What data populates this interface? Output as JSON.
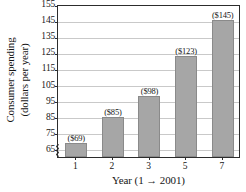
{
  "chart_data": {
    "type": "bar",
    "title": "",
    "categories": [
      "1",
      "2",
      "3",
      "5",
      "7"
    ],
    "values": [
      69,
      85,
      98,
      123,
      145
    ],
    "data_labels": [
      "($69)",
      "($85)",
      "($98)",
      "($123)",
      "($145)"
    ],
    "xlabel": "Year (1 → 2001)",
    "ylabel_line1": "Consumer spending",
    "ylabel_line2": "(dollars per year)",
    "ylim": [
      60,
      155
    ],
    "ytick_values": [
      155,
      145,
      135,
      125,
      115,
      105,
      95,
      85,
      75,
      65
    ],
    "ytick_labels": [
      "155",
      "145",
      "135",
      "125",
      "115",
      "105",
      "95",
      "85",
      "75",
      "65"
    ],
    "grid": true,
    "legend": "none",
    "axis_break": true,
    "colors": {
      "bar_fill": "#a6a6a6",
      "bar_edge": "#8a8a8a",
      "grid": "#c9c9c9",
      "frame": "#2c2c2c",
      "text": "#161616",
      "background": "#ffffff"
    }
  }
}
